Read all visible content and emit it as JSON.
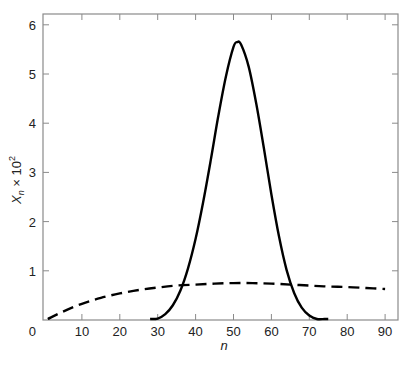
{
  "chart_data": {
    "type": "line",
    "title": "",
    "xlabel": "n",
    "ylabel": "X_n × 10^2",
    "xlim": [
      0,
      92.5
    ],
    "ylim": [
      0,
      6.2
    ],
    "grid": false,
    "legend": null,
    "x_ticks": [
      0,
      10,
      20,
      30,
      40,
      50,
      60,
      70,
      80,
      90
    ],
    "y_ticks": [
      1,
      2,
      3,
      4,
      5,
      6
    ],
    "series": [
      {
        "name": "solid",
        "style": "solid",
        "color": "#000000",
        "x": [
          28,
          30,
          32,
          34,
          36,
          38,
          40,
          42,
          44,
          46,
          48,
          50,
          51,
          52,
          54,
          56,
          58,
          60,
          62,
          64,
          66,
          68,
          70,
          72,
          74,
          75
        ],
        "y": [
          0.0,
          0.03,
          0.12,
          0.3,
          0.6,
          1.05,
          1.65,
          2.4,
          3.25,
          4.15,
          4.95,
          5.55,
          5.65,
          5.6,
          5.15,
          4.4,
          3.5,
          2.55,
          1.7,
          1.02,
          0.55,
          0.25,
          0.09,
          0.02,
          0.0,
          0.0
        ]
      },
      {
        "name": "dashed",
        "style": "dashed",
        "color": "#000000",
        "x": [
          1,
          5,
          10,
          15,
          20,
          25,
          30,
          35,
          40,
          45,
          50,
          55,
          60,
          65,
          70,
          75,
          80,
          85,
          90
        ],
        "y": [
          0.0,
          0.17,
          0.33,
          0.45,
          0.54,
          0.61,
          0.66,
          0.7,
          0.72,
          0.74,
          0.75,
          0.75,
          0.74,
          0.72,
          0.7,
          0.68,
          0.67,
          0.65,
          0.63
        ]
      }
    ]
  },
  "labels": {
    "xlabel": "n",
    "ylabel_main": "X",
    "ylabel_sub": "n",
    "ylabel_times": " × 10",
    "ylabel_sup": "2"
  }
}
